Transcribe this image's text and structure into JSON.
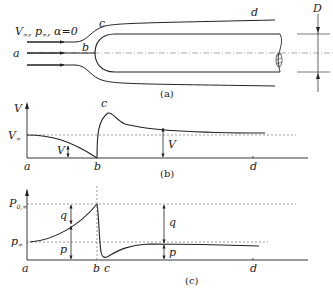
{
  "figure": {
    "panels": [
      {
        "id": "a",
        "caption": "(a)",
        "description": "Streamlines around a blunt-nosed cylindrical body of diameter D",
        "freestream_label": "V∞, p∞, α=0",
        "point_labels": [
          "a",
          "b",
          "c",
          "d"
        ],
        "dimension_label": "D"
      },
      {
        "id": "b",
        "caption": "(b)",
        "description": "Velocity distribution along the stagnation streamline and body surface",
        "y_axis_label": "V",
        "reference_label": "V∞",
        "arrow_labels": [
          "V",
          "V"
        ],
        "x_labels": [
          "a",
          "b",
          "d"
        ],
        "peak_label": "c"
      },
      {
        "id": "c",
        "caption": "(c)",
        "description": "Pressure distribution along the stagnation streamline and body surface",
        "reference_labels": [
          "P0,∞",
          "p∞"
        ],
        "arrow_labels": [
          "q",
          "p",
          "q",
          "p"
        ],
        "x_labels": [
          "a",
          "b",
          "c",
          "d"
        ]
      }
    ]
  },
  "labels": {
    "freestream_V": "V",
    "freestream_sub": "∞",
    "freestream_p": ", p",
    "freestream_alpha": ", α=0",
    "a": "a",
    "b": "b",
    "c": "c",
    "d": "d",
    "D": "D",
    "cap_a": "(a)",
    "cap_b": "(b)",
    "cap_c": "(c)",
    "V": "V",
    "V_inf": "V",
    "inf": "∞",
    "P0": "P",
    "P0_sub": "0,∞",
    "p_inf": "p",
    "q": "q",
    "p": "p"
  },
  "colors": {
    "line": "#222222",
    "dash": "#555555"
  }
}
